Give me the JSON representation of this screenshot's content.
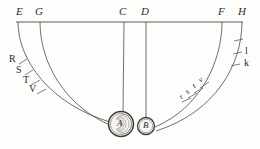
{
  "figure": {
    "kind": "geometric-diagram",
    "background_color": "#fdfdfb",
    "ink_color": "#3a3a3a",
    "baseline": {
      "y": 22,
      "x_start": 16,
      "x_end": 243
    },
    "top_labels": [
      {
        "id": "E",
        "text": "E",
        "x": 16,
        "y": 6,
        "tick_x": 18
      },
      {
        "id": "G",
        "text": "G",
        "x": 35,
        "y": 6,
        "tick_x": 40
      },
      {
        "id": "C",
        "text": "C",
        "x": 120,
        "y": 6,
        "tick_x": 124
      },
      {
        "id": "D",
        "text": "D",
        "x": 142,
        "y": 6,
        "tick_x": 146
      },
      {
        "id": "F",
        "text": "F",
        "x": 219,
        "y": 6,
        "tick_x": 222
      },
      {
        "id": "H",
        "text": "H",
        "x": 239,
        "y": 6,
        "tick_x": 242
      }
    ],
    "left_marks": [
      {
        "id": "R",
        "text": "R",
        "x": 9,
        "y": 57
      },
      {
        "id": "S",
        "text": "S",
        "x": 16,
        "y": 68
      },
      {
        "id": "T",
        "text": "T",
        "x": 23,
        "y": 79
      },
      {
        "id": "V",
        "text": "V",
        "x": 29,
        "y": 88
      }
    ],
    "right_inner_marks": [
      {
        "id": "v",
        "text": "v",
        "x": 199,
        "y": 78
      },
      {
        "id": "t",
        "text": "t",
        "x": 193,
        "y": 84
      },
      {
        "id": "s",
        "text": "s",
        "x": 187,
        "y": 90
      },
      {
        "id": "r",
        "text": "r",
        "x": 181,
        "y": 95
      }
    ],
    "right_outer_marks": [
      {
        "id": "l",
        "text": "l",
        "x": 245,
        "y": 49
      },
      {
        "id": "k",
        "text": "k",
        "x": 245,
        "y": 61
      }
    ],
    "circles": [
      {
        "id": "A",
        "text": "A",
        "cx": 121,
        "cy": 124,
        "r": 12,
        "label_x": 117,
        "label_y": 120
      },
      {
        "id": "B",
        "text": "B",
        "cx": 146,
        "cy": 126,
        "r": 8,
        "label_x": 143,
        "label_y": 122
      }
    ]
  }
}
